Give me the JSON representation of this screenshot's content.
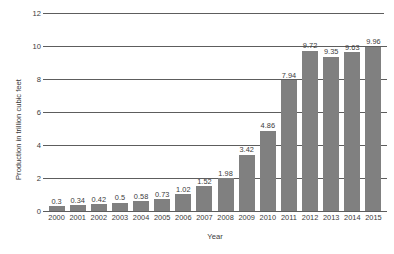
{
  "chart_data": {
    "type": "bar",
    "title": "",
    "xlabel": "Year",
    "ylabel": "Production in trillion cubic feet",
    "categories": [
      "2000",
      "2001",
      "2002",
      "2003",
      "2004",
      "2005",
      "2006",
      "2007",
      "2008",
      "2009",
      "2010",
      "2011",
      "2012",
      "2013",
      "2014",
      "2015"
    ],
    "values": [
      0.3,
      0.34,
      0.42,
      0.5,
      0.58,
      0.73,
      1.02,
      1.52,
      1.98,
      3.42,
      4.86,
      7.94,
      9.72,
      9.35,
      9.63,
      9.96
    ],
    "value_labels": [
      "0.3",
      "0.34",
      "0.42",
      "0.5",
      "0.58",
      "0.73",
      "1.02",
      "1.52",
      "1.98",
      "3.42",
      "4.86",
      "7.94",
      "9.72",
      "9.35",
      "9.63",
      "9.96"
    ],
    "ylim": [
      0,
      12
    ],
    "yticks": [
      0,
      2,
      4,
      6,
      8,
      10,
      12
    ],
    "ytick_labels": [
      "0",
      "2",
      "4",
      "6",
      "8",
      "10",
      "12"
    ],
    "grid": true,
    "legend": false,
    "bar_color": "#808080",
    "grid_color": "#5d5d5d",
    "text_color": "#3b3b3b"
  }
}
